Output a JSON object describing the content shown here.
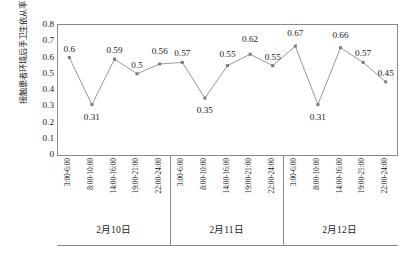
{
  "chart_data": {
    "type": "line",
    "title": "",
    "xlabel": "",
    "ylabel": "接触患者环境后手卫生依从率（%）",
    "ylim": [
      0,
      0.8
    ],
    "ytick_labels": [
      "0.8",
      "0.7",
      "0.6",
      "0.5",
      "0.4",
      "0.3",
      "0.2",
      "0.1",
      "0"
    ],
    "ytick_values": [
      0.8,
      0.7,
      0.6,
      0.5,
      0.4,
      0.3,
      0.2,
      0.1,
      0
    ],
    "grid": false,
    "legend": "none",
    "marker": "square",
    "line_color": "#9a9a9a",
    "marker_color": "#7a7a7a",
    "groups": [
      {
        "label": "2月10日",
        "categories": [
          "3:00-6:00",
          "8:00-10:00",
          "14:00-16:00",
          "19:00-21:00",
          "22:00-24:00"
        ],
        "values": [
          0.6,
          0.31,
          0.59,
          0.5,
          0.56
        ]
      },
      {
        "label": "2月11日",
        "categories": [
          "3:00-6:00",
          "8:00-10:00",
          "14:00-16:00",
          "19:00-21:00",
          "22:00-24:00"
        ],
        "values": [
          0.57,
          0.35,
          0.55,
          0.62,
          0.55
        ]
      },
      {
        "label": "2月12日",
        "categories": [
          "3:00-6:00",
          "8:00-10:00",
          "14:00-16:00",
          "19:00-21:00",
          "22:00-24:00"
        ],
        "values": [
          0.67,
          0.31,
          0.66,
          0.57,
          0.45
        ]
      }
    ],
    "point_labels": [
      "0.6",
      "0.31",
      "0.59",
      "0.5",
      "0.56",
      "0.57",
      "0.35",
      "0.55",
      "0.62",
      "0.55",
      "0.67",
      "0.31",
      "0.66",
      "0.57",
      "0.45"
    ],
    "label_positions": [
      "above",
      "below",
      "above",
      "above",
      "above",
      "above",
      "below",
      "above",
      "above",
      "above",
      "above",
      "below",
      "above",
      "above",
      "above"
    ]
  }
}
